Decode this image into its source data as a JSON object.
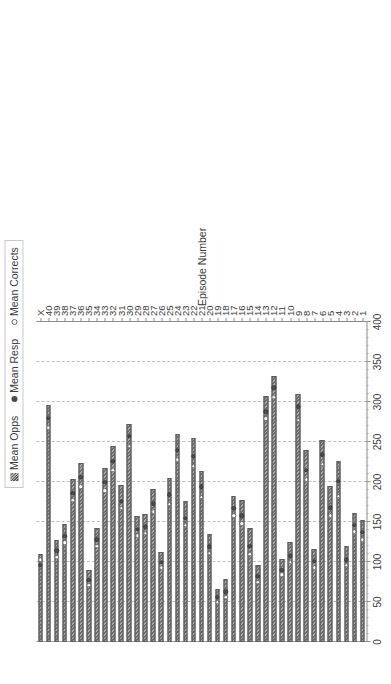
{
  "legend": {
    "position": "top",
    "items": [
      {
        "label": "Mean Opps",
        "marker": "bar-swatch-icon"
      },
      {
        "label": "Mean Resp",
        "marker": "filled-dot-icon"
      },
      {
        "label": "Mean Corrects",
        "marker": "open-dot-icon"
      }
    ]
  },
  "axes": {
    "category_title": "Episode Number",
    "value_ticks": [
      "0",
      "50",
      "100",
      "150",
      "200",
      "250",
      "300",
      "350",
      "400"
    ],
    "value_min": 0,
    "value_max": 400
  },
  "chart_data": {
    "type": "bar",
    "orientation": "horizontal",
    "title": "",
    "xlabel": "",
    "ylabel": "Episode Number",
    "xlim": [
      0,
      400
    ],
    "grid": true,
    "grid_axis": "value",
    "legend_position": "top",
    "categories": [
      "1",
      "2",
      "3",
      "4",
      "5",
      "6",
      "7",
      "8",
      "9",
      "10",
      "11",
      "12",
      "13",
      "14",
      "15",
      "16",
      "17",
      "18",
      "19",
      "20",
      "21",
      "22",
      "23",
      "24",
      "25",
      "26",
      "27",
      "28",
      "29",
      "30",
      "31",
      "32",
      "33",
      "34",
      "35",
      "36",
      "37",
      "38",
      "39",
      "40",
      "X"
    ],
    "series": [
      {
        "name": "Mean Opps",
        "marker": "bar",
        "values": [
          152,
          161,
          120,
          226,
          195,
          253,
          116,
          240,
          310,
          125,
          104,
          332,
          307,
          96,
          142,
          178,
          183,
          79,
          66,
          135,
          214,
          255,
          176,
          260,
          205,
          113,
          191,
          160,
          158,
          273,
          196,
          245,
          218,
          143,
          90,
          224,
          204,
          148,
          128,
          296,
          110
        ]
      },
      {
        "name": "Mean Resp",
        "marker": "filled-dot",
        "values": [
          137,
          146,
          103,
          201,
          168,
          234,
          101,
          215,
          294,
          108,
          90,
          318,
          288,
          82,
          120,
          158,
          167,
          63,
          56,
          119,
          194,
          232,
          155,
          240,
          184,
          100,
          173,
          144,
          141,
          257,
          176,
          226,
          200,
          128,
          77,
          206,
          186,
          132,
          114,
          280,
          96
        ]
      },
      {
        "name": "Mean Corrects",
        "marker": "open-dot",
        "values": [
          128,
          138,
          96,
          182,
          158,
          222,
          93,
          203,
          277,
          100,
          84,
          306,
          279,
          75,
          110,
          148,
          158,
          56,
          50,
          111,
          181,
          220,
          146,
          228,
          172,
          93,
          163,
          136,
          133,
          245,
          167,
          215,
          189,
          120,
          71,
          194,
          177,
          124,
          106,
          268,
          103
        ]
      }
    ]
  }
}
